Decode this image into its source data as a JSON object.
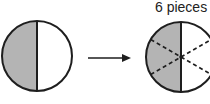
{
  "diagram": {
    "label": "6 pieces",
    "colors": {
      "shaded": "#b4b4b4",
      "stroke": "#1e1e1e",
      "background": "#ffffff"
    },
    "left_circle": {
      "cx": 37,
      "cy": 56,
      "r": 35,
      "shaded_half": "left"
    },
    "arrow": {
      "x1": 88,
      "x2": 130,
      "y": 58
    },
    "right_circle": {
      "cx": 181,
      "cy": 57,
      "r": 35,
      "shaded_half": "left",
      "dashed_cuts": 2,
      "pieces": 6
    }
  }
}
